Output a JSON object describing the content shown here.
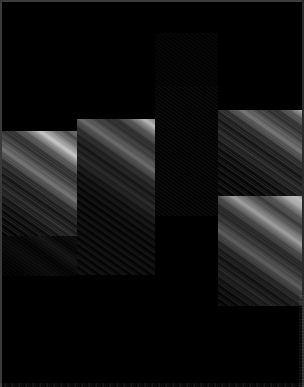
{
  "image": {
    "title": "Saturn ring mosaic",
    "subject": "planetary-ring-system",
    "background_color": "#000000",
    "frame_color": "#3a3a3a",
    "band_highlight_color": "#ffffff",
    "width_px": 304,
    "height_px": 387,
    "band_angle_deg": 35,
    "description": "Dark-field mosaic of narrow bright ringlet bands running diagonally from upper-left to lower-right, assembled from offset rectangular image tiles."
  },
  "mosaic": {
    "tiles": [
      {
        "name": "tile-left-bright",
        "left": 2,
        "top": 131,
        "width": 75,
        "height": 134,
        "kind": "bright",
        "dim": ""
      },
      {
        "name": "tile-center-bright",
        "left": 77,
        "top": 119,
        "width": 78,
        "height": 156,
        "kind": "bright",
        "dim": "dim-1"
      },
      {
        "name": "tile-center-dark-upper",
        "left": 155,
        "top": 33,
        "width": 63,
        "height": 118,
        "kind": "faint",
        "dim": "dim-3"
      },
      {
        "name": "tile-center-dark-mid",
        "left": 155,
        "top": 86,
        "width": 63,
        "height": 130,
        "kind": "faint",
        "dim": "dim-2"
      },
      {
        "name": "tile-center-dark-lower",
        "left": 155,
        "top": 290,
        "width": 75,
        "height": 80,
        "kind": "streak",
        "dim": "dim-2"
      },
      {
        "name": "tile-right-bright",
        "left": 218,
        "top": 110,
        "width": 84,
        "height": 170,
        "kind": "bright",
        "dim": ""
      },
      {
        "name": "tile-right-lower",
        "left": 218,
        "top": 196,
        "width": 84,
        "height": 110,
        "kind": "bright",
        "dim": "dim-2"
      },
      {
        "name": "tile-left-faint-lower",
        "left": 2,
        "top": 236,
        "width": 75,
        "height": 40,
        "kind": "faint",
        "dim": "dim-3"
      }
    ]
  },
  "overlays": {
    "bottom_noise": "sensor-noise-strip",
    "right_noise": "sensor-noise-column"
  }
}
